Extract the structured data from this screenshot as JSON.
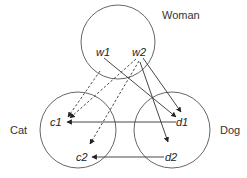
{
  "diagram": {
    "type": "set-mapping",
    "sets": [
      {
        "id": "woman",
        "label": "Woman",
        "cx": 118,
        "cy": 42,
        "r": 37,
        "label_x": 162,
        "label_y": 19
      },
      {
        "id": "cat",
        "label": "Cat",
        "cx": 78,
        "cy": 130,
        "r": 38,
        "label_x": 10,
        "label_y": 134
      },
      {
        "id": "dog",
        "label": "Dog",
        "cx": 172,
        "cy": 130,
        "r": 38,
        "label_x": 220,
        "label_y": 134
      }
    ],
    "nodes": [
      {
        "id": "w1",
        "label": "w1",
        "set": "woman",
        "x": 96,
        "y": 56
      },
      {
        "id": "w2",
        "label": "w2",
        "set": "woman",
        "x": 132,
        "y": 56
      },
      {
        "id": "c1",
        "label": "c1",
        "set": "cat",
        "x": 50,
        "y": 126
      },
      {
        "id": "c2",
        "label": "c2",
        "set": "cat",
        "x": 76,
        "y": 161
      },
      {
        "id": "d1",
        "label": "d1",
        "set": "dog",
        "x": 176,
        "y": 126
      },
      {
        "id": "d2",
        "label": "d2",
        "set": "dog",
        "x": 165,
        "y": 161
      }
    ],
    "edges": [
      {
        "from": "w1",
        "to": "c1",
        "style": "dashed",
        "x1": 100,
        "y1": 71,
        "x2": 68,
        "y2": 117
      },
      {
        "from": "w2",
        "to": "c1",
        "style": "dashed",
        "x1": 136,
        "y1": 59,
        "x2": 70,
        "y2": 118
      },
      {
        "from": "w2",
        "to": "c2",
        "style": "dashed",
        "x1": 139,
        "y1": 61,
        "x2": 90,
        "y2": 144
      },
      {
        "from": "w1",
        "to": "d1",
        "style": "solid",
        "x1": 104,
        "y1": 58,
        "x2": 176,
        "y2": 117
      },
      {
        "from": "w2",
        "to": "d1",
        "style": "solid",
        "x1": 143,
        "y1": 58,
        "x2": 181,
        "y2": 112
      },
      {
        "from": "w2",
        "to": "d2",
        "style": "solid",
        "x1": 140,
        "y1": 62,
        "x2": 168,
        "y2": 142
      },
      {
        "from": "d1",
        "to": "c1",
        "style": "solid",
        "x1": 176,
        "y1": 122,
        "x2": 67,
        "y2": 122
      },
      {
        "from": "d2",
        "to": "c2",
        "style": "solid",
        "x1": 164,
        "y1": 157,
        "x2": 92,
        "y2": 157
      }
    ],
    "colors": {
      "circle_stroke": "#555555",
      "edge": "#333333",
      "text": "#333333"
    }
  }
}
